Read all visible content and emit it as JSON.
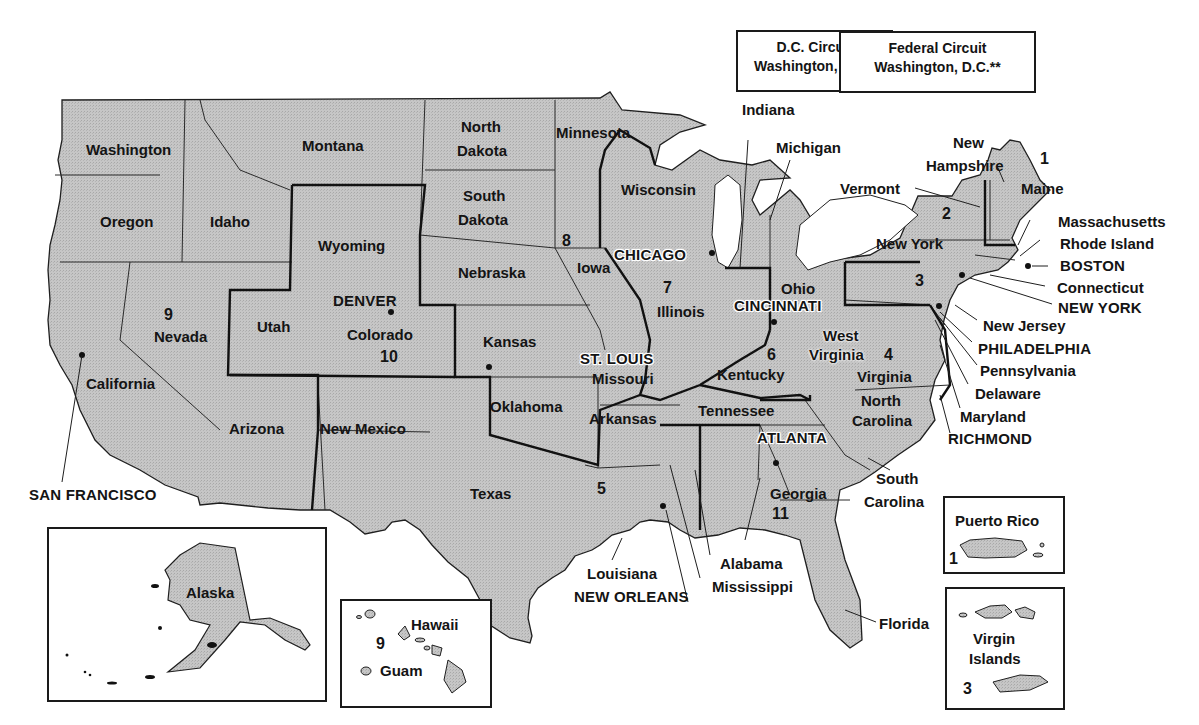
{
  "map_title": "",
  "colors": {
    "land_fill": "#c4c4c4",
    "border": "#1f1f1f",
    "background": "#ffffff",
    "text": "#141414"
  },
  "circuit_boxes": {
    "dc": {
      "line1": "D.C. Circuit",
      "line2": "Washington, D.C.*"
    },
    "federal": {
      "line1": "Federal Circuit",
      "line2": "Washington, D.C.**"
    }
  },
  "states": {
    "washington": "Washington",
    "oregon": "Oregon",
    "california": "California",
    "nevada": "Nevada",
    "idaho": "Idaho",
    "montana": "Montana",
    "wyoming": "Wyoming",
    "utah": "Utah",
    "arizona": "Arizona",
    "colorado": "Colorado",
    "new_mexico": "New Mexico",
    "north_dakota_1": "North",
    "north_dakota_2": "Dakota",
    "south_dakota_1": "South",
    "south_dakota_2": "Dakota",
    "nebraska": "Nebraska",
    "kansas": "Kansas",
    "oklahoma": "Oklahoma",
    "texas": "Texas",
    "minnesota": "Minnesota",
    "iowa": "Iowa",
    "missouri": "Missouri",
    "arkansas": "Arkansas",
    "louisiana": "Louisiana",
    "wisconsin": "Wisconsin",
    "illinois": "Illinois",
    "michigan": "Michigan",
    "indiana": "Indiana",
    "ohio": "Ohio",
    "kentucky": "Kentucky",
    "tennessee": "Tennessee",
    "mississippi": "Mississippi",
    "alabama": "Alabama",
    "georgia": "Georgia",
    "florida": "Florida",
    "south_carolina_1": "South",
    "south_carolina_2": "Carolina",
    "north_carolina_1": "North",
    "north_carolina_2": "Carolina",
    "virginia": "Virginia",
    "west_virginia_1": "West",
    "west_virginia_2": "Virginia",
    "maryland": "Maryland",
    "delaware": "Delaware",
    "pennsylvania": "Pennsylvania",
    "new_jersey": "New Jersey",
    "new_york": "New York",
    "connecticut": "Connecticut",
    "rhode_island": "Rhode Island",
    "massachusetts": "Massachusetts",
    "vermont": "Vermont",
    "new_hampshire_1": "New",
    "new_hampshire_2": "Hampshire",
    "maine": "Maine",
    "alaska": "Alaska",
    "hawaii": "Hawaii",
    "guam": "Guam",
    "puerto_rico": "Puerto Rico",
    "virgin_islands_1": "Virgin",
    "virgin_islands_2": "Islands"
  },
  "cities": {
    "san_francisco": "SAN FRANCISCO",
    "denver": "DENVER",
    "st_louis": "ST. LOUIS",
    "chicago": "CHICAGO",
    "cincinnati": "CINCINNATI",
    "atlanta": "ATLANTA",
    "new_orleans": "NEW ORLEANS",
    "richmond": "RICHMOND",
    "philadelphia": "PHILADELPHIA",
    "new_york": "NEW YORK",
    "boston": "BOSTON"
  },
  "circuit_numbers": {
    "c1_maine": "1",
    "c1_puerto_rico": "1",
    "c2": "2",
    "c3": "3",
    "c3_virgin_islands": "3",
    "c4": "4",
    "c5": "5",
    "c6": "6",
    "c7": "7",
    "c8": "8",
    "c9": "9",
    "c9_hawaii": "9",
    "c10": "10",
    "c11": "11"
  }
}
